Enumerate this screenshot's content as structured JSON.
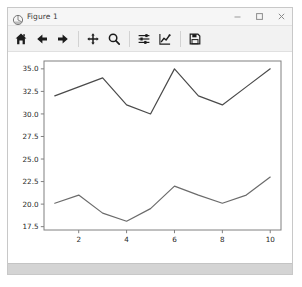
{
  "window": {
    "title": "Figure 1",
    "app_icon": "matplotlib-icon",
    "controls": {
      "minimize_label": "Minimize",
      "maximize_label": "Maximize",
      "close_label": "Close"
    }
  },
  "toolbar": {
    "items": [
      {
        "name": "home-icon",
        "label": "Reset original view"
      },
      {
        "name": "back-arrow-icon",
        "label": "Back to previous view"
      },
      {
        "name": "forward-arrow-icon",
        "label": "Forward to next view"
      },
      {
        "name": "pan-icon",
        "label": "Pan axes with left mouse, zoom with right"
      },
      {
        "name": "zoom-magnifier-icon",
        "label": "Zoom to rectangle"
      },
      {
        "name": "configure-subplots-icon",
        "label": "Configure subplots"
      },
      {
        "name": "edit-axis-icon",
        "label": "Edit axis, curve and image parameters"
      },
      {
        "name": "save-floppy-icon",
        "label": "Save the figure"
      }
    ]
  },
  "status_bar": {
    "text": ""
  },
  "chart_data": {
    "type": "line",
    "title": "",
    "xlabel": "",
    "ylabel": "",
    "x": [
      1,
      2,
      3,
      4,
      5,
      6,
      7,
      8,
      9,
      10
    ],
    "xlim": [
      0.55,
      10.45
    ],
    "ylim": [
      17.13,
      35.87
    ],
    "xticks": [
      2,
      4,
      6,
      8,
      10
    ],
    "xtick_labels": [
      "2",
      "4",
      "6",
      "8",
      "10"
    ],
    "yticks": [
      17.5,
      20.0,
      22.5,
      25.0,
      27.5,
      30.0,
      32.5,
      35.0
    ],
    "ytick_labels": [
      "17.5",
      "20.0",
      "22.5",
      "25.0",
      "27.5",
      "30.0",
      "32.5",
      "35.0"
    ],
    "grid": false,
    "legend": false,
    "series": [
      {
        "name": "upper",
        "color": "#4a4a4a",
        "values": [
          32.0,
          33.0,
          34.0,
          31.0,
          30.0,
          35.0,
          32.0,
          31.0,
          33.0,
          35.0
        ]
      },
      {
        "name": "lower",
        "color": "#6b6b6b",
        "values": [
          20.1,
          21.0,
          19.0,
          18.1,
          19.5,
          22.0,
          21.0,
          20.1,
          21.0,
          23.0
        ]
      }
    ]
  }
}
